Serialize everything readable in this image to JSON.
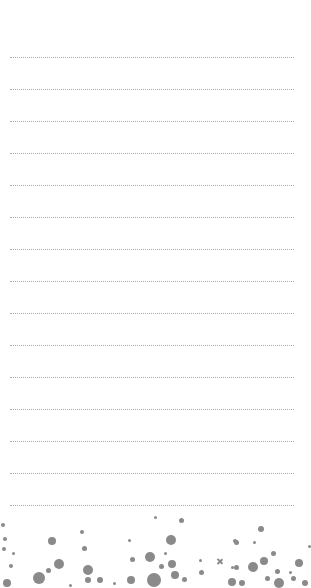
{
  "page": {
    "type": "lined-notepad",
    "background": "#ffffff",
    "line_color": "#aaaaaa",
    "line_style": "dotted",
    "line_count": 15,
    "first_line_y": 57,
    "line_spacing": 32,
    "line_left": 10,
    "line_width": 284
  },
  "lines": [
    {
      "text": ""
    },
    {
      "text": ""
    },
    {
      "text": ""
    },
    {
      "text": ""
    },
    {
      "text": ""
    },
    {
      "text": ""
    },
    {
      "text": ""
    },
    {
      "text": ""
    },
    {
      "text": ""
    },
    {
      "text": ""
    },
    {
      "text": ""
    },
    {
      "text": ""
    },
    {
      "text": ""
    },
    {
      "text": ""
    },
    {
      "text": ""
    }
  ],
  "decoration": {
    "name": "confetti-footer",
    "color": "#8a8a8a",
    "dots": [
      [
        3,
        525,
        2
      ],
      [
        5,
        539,
        2
      ],
      [
        4,
        549,
        2
      ],
      [
        13,
        553,
        1.5
      ],
      [
        11,
        566,
        2
      ],
      [
        52,
        541,
        4
      ],
      [
        59,
        564,
        5
      ],
      [
        48,
        570,
        2.5
      ],
      [
        39,
        578,
        6
      ],
      [
        7,
        583,
        4
      ],
      [
        70,
        585,
        1.5
      ],
      [
        82,
        532,
        2
      ],
      [
        84,
        548,
        2.5
      ],
      [
        88,
        570,
        5
      ],
      [
        88,
        580,
        3
      ],
      [
        100,
        580,
        3
      ],
      [
        114,
        583,
        1.5
      ],
      [
        129,
        540,
        1.5
      ],
      [
        132,
        559,
        2.5
      ],
      [
        131,
        580,
        4
      ],
      [
        150,
        557,
        5
      ],
      [
        154,
        580,
        7
      ],
      [
        155,
        517,
        1.5
      ],
      [
        181,
        520,
        2.5
      ],
      [
        171,
        540,
        5
      ],
      [
        165,
        553,
        1.5
      ],
      [
        172,
        564,
        4
      ],
      [
        200,
        560,
        1.5
      ],
      [
        161,
        566,
        2.5
      ],
      [
        175,
        575,
        4
      ],
      [
        184,
        579,
        2.5
      ],
      [
        201,
        572,
        2.5
      ],
      [
        235,
        541,
        2
      ],
      [
        232,
        567,
        1.5
      ],
      [
        232,
        582,
        4
      ],
      [
        261,
        529,
        3
      ],
      [
        236,
        542,
        2.5
      ],
      [
        254,
        542,
        1.5
      ],
      [
        273,
        553,
        2.5
      ],
      [
        264,
        561,
        4
      ],
      [
        253,
        567,
        5
      ],
      [
        236,
        567,
        2.5
      ],
      [
        277,
        571,
        2.5
      ],
      [
        299,
        563,
        4
      ],
      [
        290,
        572,
        1.5
      ],
      [
        267,
        578,
        2.5
      ],
      [
        242,
        583,
        3
      ],
      [
        279,
        583,
        5
      ],
      [
        293,
        578,
        2.5
      ],
      [
        305,
        583,
        3
      ],
      [
        309,
        546,
        1.5
      ]
    ],
    "crosses": [
      [
        219,
        561
      ]
    ]
  }
}
